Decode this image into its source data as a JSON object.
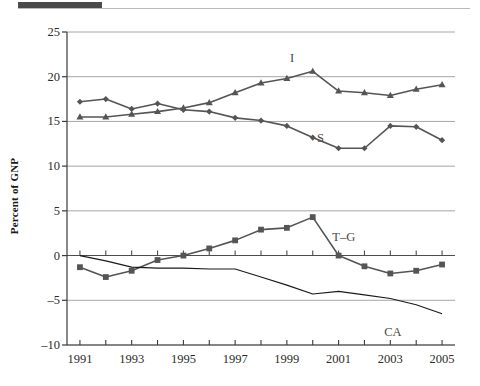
{
  "page": {
    "top_bar_color": "#4a4a4a",
    "background": "#ffffff"
  },
  "chart_data": {
    "type": "line",
    "title": "",
    "subtitle": "",
    "xlabel": "",
    "ylabel": "Percent of GNP",
    "xlim": [
      1990.5,
      2005.5
    ],
    "ylim": [
      -10,
      25
    ],
    "yticks": [
      25,
      20,
      15,
      10,
      5,
      0,
      -5,
      -10
    ],
    "ytick_labels": [
      "25",
      "20",
      "15",
      "10",
      "5",
      "0",
      "–5",
      "–10"
    ],
    "xticks": [
      1991,
      1992,
      1993,
      1994,
      1995,
      1996,
      1997,
      1998,
      1999,
      2000,
      2001,
      2002,
      2003,
      2004,
      2005
    ],
    "xtick_labels_shown": [
      "1991",
      "1993",
      "1995",
      "1997",
      "1999",
      "2001",
      "2003",
      "2005"
    ],
    "grid": "horizontal-gridlines-at-yticks",
    "legend_position": "inline-annotations",
    "x": [
      1991,
      1992,
      1993,
      1994,
      1995,
      1996,
      1997,
      1998,
      1999,
      2000,
      2001,
      2002,
      2003,
      2004,
      2005
    ],
    "series": [
      {
        "name": "I",
        "label": "I",
        "marker": "triangle",
        "color": "#555555",
        "label_pos": {
          "x": 1999.2,
          "y": 22.1
        },
        "values": [
          15.5,
          15.5,
          15.8,
          16.1,
          16.5,
          17.1,
          18.2,
          19.3,
          19.8,
          20.6,
          18.4,
          18.2,
          17.9,
          18.6,
          19.1
        ]
      },
      {
        "name": "S",
        "label": "S",
        "marker": "diamond",
        "color": "#555555",
        "label_pos": {
          "x": 2000.3,
          "y": 13.2
        },
        "values": [
          17.2,
          17.5,
          16.4,
          17.0,
          16.3,
          16.1,
          15.4,
          15.1,
          14.5,
          13.2,
          12.0,
          12.0,
          14.5,
          14.4,
          12.9
        ]
      },
      {
        "name": "T–G",
        "label": "T–G",
        "marker": "square",
        "color": "#555555",
        "label_pos": {
          "x": 2001.2,
          "y": 2.1
        },
        "values": [
          -1.3,
          -2.4,
          -1.7,
          -0.5,
          0.0,
          0.8,
          1.7,
          2.9,
          3.1,
          4.3,
          0.0,
          -1.2,
          -2.0,
          -1.7,
          -1.0
        ]
      },
      {
        "name": "CA",
        "label": "CA",
        "marker": "none",
        "color": "#1a1a1a",
        "label_pos": {
          "x": 2003.1,
          "y": -8.5
        },
        "values": [
          0.0,
          -0.6,
          -1.3,
          -1.4,
          -1.4,
          -1.5,
          -1.5,
          -2.4,
          -3.3,
          -4.3,
          -4.0,
          -4.4,
          -4.8,
          -5.5,
          -6.5
        ]
      }
    ]
  }
}
